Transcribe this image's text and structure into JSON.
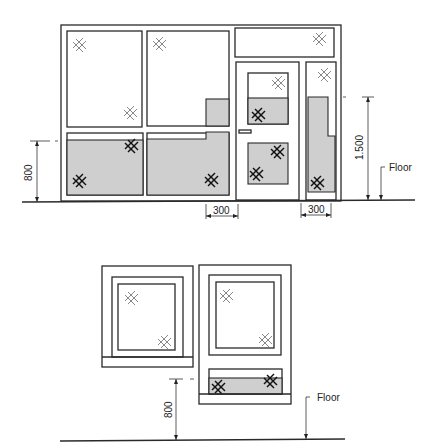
{
  "figure_top": {
    "title": "Shopfront elevation with glazed door and side light",
    "dimensions": {
      "sill_height_label": "800",
      "side_light_height_label": "1.500",
      "clearance_left_label": "300",
      "clearance_right_label": "300"
    },
    "floor_label": "Floor"
  },
  "figure_bottom": {
    "title": "Window elevations with low-level panel",
    "dimensions": {
      "sill_height_label": "800"
    },
    "floor_label": "Floor"
  },
  "legend": {
    "light_mark": "clear-glass-mark",
    "dark_mark": "safety-glass-mark",
    "tint_color": "#cfcfcf",
    "line_color": "#2a2a2a"
  }
}
